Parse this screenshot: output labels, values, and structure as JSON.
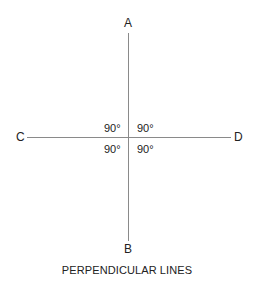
{
  "diagram": {
    "title": "PERPENDICULAR LINES",
    "points": {
      "top": "A",
      "bottom": "B",
      "left": "C",
      "right": "D"
    },
    "angles": {
      "upper_left": "90°",
      "upper_right": "90°",
      "lower_left": "90°",
      "lower_right": "90°"
    },
    "line_color": "#8a8a8a"
  }
}
